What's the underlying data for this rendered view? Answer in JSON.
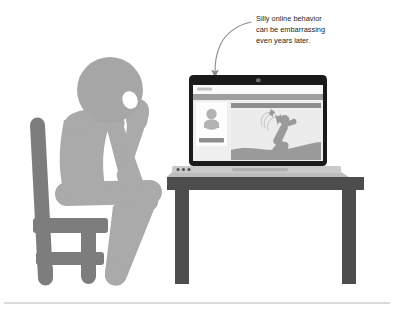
{
  "figure": {
    "type": "illustration",
    "background_color": "#ffffff"
  },
  "callout": {
    "name": "silly-online-behavior-callout",
    "lines": [
      "Silly online behavior",
      "can be embarrassing",
      "even years later."
    ],
    "full_text": "Silly online behavior can be embarrassing even years later.",
    "text_color": "#231f20",
    "arrow": {
      "name": "curved-arrow-to-laptop",
      "color": "#8c8c8c",
      "direction": "down",
      "points_to": "laptop-screen"
    }
  },
  "person": {
    "name": "seated-person",
    "pose": "hand-on-chin-thinking",
    "body_color": "#aaaaaa",
    "head_color": "#a6a6a6",
    "eye_color": "#ffffff"
  },
  "chair": {
    "name": "chair",
    "color": "#7d7d7d"
  },
  "desk": {
    "name": "desk",
    "color": "#4d4d4d"
  },
  "laptop": {
    "name": "laptop",
    "bezel_color": "#1a1a1a",
    "base_color": "#c9c9c9",
    "screen_color": "#f4f4f4",
    "webcam": "webcam-dot",
    "trackpad": "trackpad",
    "indicator_lights": 3,
    "screen": {
      "name": "social-profile-page",
      "site_logo": "site-logo",
      "nav_bar": "nav-bar",
      "profile_card": {
        "name": "profile-card",
        "avatar": "avatar",
        "action_button": "profile-action-button"
      },
      "post": {
        "name": "post-photo",
        "header_bar": "post-header-bar",
        "image_subject": "falling-stick-figure",
        "figure_color": "#9a9a9a",
        "ground_color": "#9a9a9a"
      }
    }
  },
  "footer_rule": {
    "name": "footer-divider",
    "color": "#b5b5b5"
  }
}
